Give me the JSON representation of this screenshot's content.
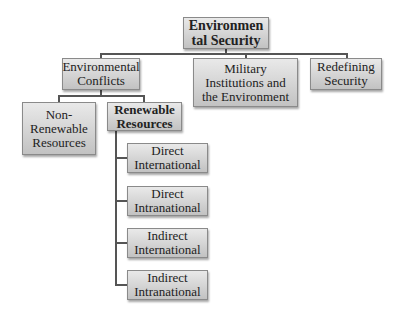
{
  "diagram": {
    "root": "Environmental Security",
    "root_display": "Environmen tal Security",
    "level1": [
      {
        "label": "Environmental Conflicts"
      },
      {
        "label": "Military Institutions and the Environment"
      },
      {
        "label": "Redefining Security"
      }
    ],
    "level2": [
      {
        "label": "Non-Renewable Resources"
      },
      {
        "label": "Renewable Resources"
      }
    ],
    "level3": [
      {
        "label": "Direct International"
      },
      {
        "label": "Direct Intranational"
      },
      {
        "label": "Indirect International"
      },
      {
        "label": "Indirect Intranational"
      }
    ],
    "line_color": "#555555",
    "box_gradient": [
      "#e9e9e9",
      "#c2c2c2"
    ]
  }
}
